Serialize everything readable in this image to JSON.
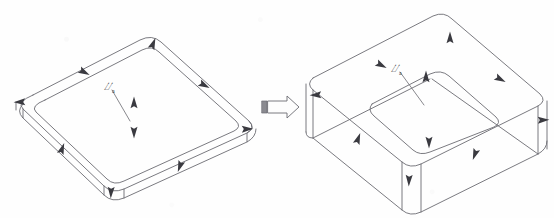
{
  "figure": {
    "background_color": "#fefefe",
    "line_color": "#6b6b72",
    "arrowhead_color": "#3a3a40",
    "label_color": "#2e2e33",
    "line_width": 0.9
  },
  "labels": {
    "left_symbol": "⌰",
    "left_subscript": "a",
    "right_symbol": "⌰",
    "right_subscript": "a"
  },
  "transition": {
    "name": "block-arrow",
    "direction": "right",
    "fill": "#fdfdfd",
    "stroke": "#6b6b72",
    "tail_bar_fill": "#8a8a90"
  },
  "left_shape": {
    "name": "thin-slab",
    "type": "isometric-plate",
    "corner_radius": 14,
    "top_face_outer": [
      [
        20,
        99
      ],
      [
        152,
        32
      ],
      [
        247,
        120
      ],
      [
        112,
        188
      ]
    ],
    "top_face_inner": [
      [
        36,
        102
      ],
      [
        152,
        44
      ],
      [
        232,
        120
      ],
      [
        113,
        177
      ]
    ],
    "thickness_px": 9,
    "arrowheads": 8
  },
  "right_shape": {
    "name": "thick-box",
    "type": "isometric-block",
    "corner_radius": 14,
    "top_face_outer": [
      [
        313,
        70
      ],
      [
        444,
        13
      ],
      [
        541,
        96
      ],
      [
        410,
        161
      ]
    ],
    "top_face_inner": [
      [
        372,
        98
      ],
      [
        441,
        68
      ],
      [
        494,
        114
      ],
      [
        420,
        146
      ]
    ],
    "thickness_px": 48,
    "arrowheads": 9
  },
  "arrow_marks": {
    "left": [
      {
        "x": 152,
        "y": 44,
        "rot": 20
      },
      {
        "x": 83,
        "y": 70,
        "rot": 118
      },
      {
        "x": 202,
        "y": 83,
        "rot": 118
      },
      {
        "x": 19,
        "y": 99,
        "rot": 268
      },
      {
        "x": 246,
        "y": 126,
        "rot": 88
      },
      {
        "x": 61,
        "y": 147,
        "rot": 20
      },
      {
        "x": 178,
        "y": 163,
        "rot": 200
      },
      {
        "x": 110,
        "y": 191,
        "rot": 182
      },
      {
        "x": 133,
        "y": 102,
        "rot": 0
      },
      {
        "x": 133,
        "y": 131,
        "rot": 180
      }
    ],
    "right": [
      {
        "x": 448,
        "y": 37,
        "rot": 0
      },
      {
        "x": 380,
        "y": 64,
        "rot": 118
      },
      {
        "x": 498,
        "y": 77,
        "rot": 118
      },
      {
        "x": 315,
        "y": 93,
        "rot": 268
      },
      {
        "x": 424,
        "y": 76,
        "rot": 0
      },
      {
        "x": 542,
        "y": 118,
        "rot": 88
      },
      {
        "x": 357,
        "y": 137,
        "rot": 20
      },
      {
        "x": 428,
        "y": 140,
        "rot": 180
      },
      {
        "x": 473,
        "y": 152,
        "rot": 200
      },
      {
        "x": 408,
        "y": 178,
        "rot": 182
      }
    ]
  }
}
